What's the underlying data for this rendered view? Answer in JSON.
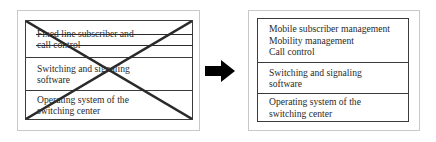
{
  "diagram": {
    "type": "before-after-transformation",
    "accent_color": "#000000",
    "frame_color": "#c9c9c9",
    "box_border_color": "#3b3b3b",
    "text_color": "#2a2a2a"
  },
  "before": {
    "name": "fixed-line-switching-center",
    "layers": [
      {
        "id": "application-layer",
        "struck_out": true,
        "lines": [
          "Fixed line subscriber and",
          "call control"
        ]
      },
      {
        "id": "switching-signaling-layer",
        "struck_out": false,
        "lines": [
          "Switching and signaling",
          "software"
        ]
      },
      {
        "id": "operating-system-layer",
        "struck_out": false,
        "lines": [
          "Operating system of the",
          "switching center"
        ]
      }
    ]
  },
  "arrow": {
    "name": "transformation-arrow",
    "direction": "right",
    "color": "#000000"
  },
  "after": {
    "name": "mobile-switching-center",
    "layers": [
      {
        "id": "application-layer",
        "struck_out": false,
        "lines": [
          "Mobile subscriber management",
          "Mobility management",
          "Call control"
        ]
      },
      {
        "id": "switching-signaling-layer",
        "struck_out": false,
        "lines": [
          "Switching and signaling",
          "software"
        ]
      },
      {
        "id": "operating-system-layer",
        "struck_out": false,
        "lines": [
          "Operating system of the",
          "switching center"
        ]
      }
    ]
  }
}
